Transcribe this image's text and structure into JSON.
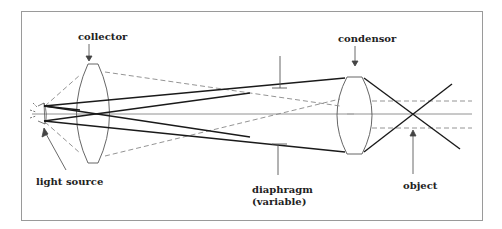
{
  "diagram": {
    "labels": {
      "collector": "collector",
      "light_source": "light source",
      "diaphragm_line1": "diaphragm",
      "diaphragm_line2": "(variable)",
      "condensor": "condensor",
      "object": "object"
    },
    "colors": {
      "border": "#999999",
      "solid_ray": "#1a1a1a",
      "dashed_ray": "#888888",
      "lens": "#555555",
      "axis": "#777777"
    }
  }
}
